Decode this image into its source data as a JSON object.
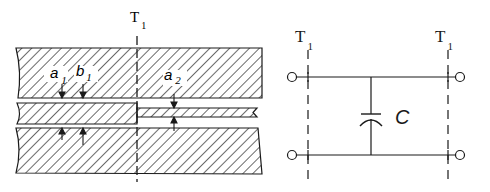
{
  "figure": {
    "left": {
      "title": "cross-section of coupled strip/gap structure",
      "section_label": {
        "main": "T",
        "sub": "1"
      },
      "dimension_labels": [
        {
          "main": "a",
          "sub": "1"
        },
        {
          "main": "b",
          "sub": "1"
        },
        {
          "main": "a",
          "sub": "2"
        }
      ]
    },
    "right": {
      "title": "equivalent circuit",
      "section_labels": [
        {
          "main": "T",
          "sub": "1"
        },
        {
          "main": "T",
          "sub": "1"
        }
      ],
      "capacitor_label": "C"
    },
    "colors": {
      "line": "#1a1a1a",
      "background": "#ffffff"
    }
  }
}
